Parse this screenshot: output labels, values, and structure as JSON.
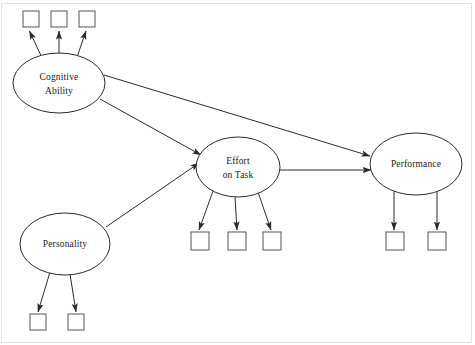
{
  "diagram": {
    "type": "structural-equation-model-path-diagram",
    "background_color": "#ffffff",
    "line_color": "#2b2b2b",
    "indicator_stroke_color": "#555555",
    "frame_color": "#e2e2e2",
    "latent_variables": [
      {
        "id": "cognitive-ability",
        "label_line_1": "Cognitive",
        "label_line_2": "Ability",
        "cx": 59,
        "cy": 83,
        "rx": 46,
        "ry": 30
      },
      {
        "id": "personality",
        "label_line_1": "Personality",
        "label_line_2": "",
        "cx": 65,
        "cy": 244,
        "rx": 45,
        "ry": 31
      },
      {
        "id": "effort-on-task",
        "label_line_1": "Effort",
        "label_line_2": "on Task",
        "cx": 238,
        "cy": 167,
        "rx": 42,
        "ry": 30
      },
      {
        "id": "performance",
        "label_line_1": "Performance",
        "label_line_2": "",
        "cx": 416,
        "cy": 164,
        "rx": 46,
        "ry": 31
      }
    ],
    "indicators": [
      {
        "id": "cognitive-ability-indicator-1",
        "x": 23,
        "y": 11,
        "size": 16
      },
      {
        "id": "cognitive-ability-indicator-2",
        "x": 51,
        "y": 11,
        "size": 16
      },
      {
        "id": "cognitive-ability-indicator-3",
        "x": 79,
        "y": 11,
        "size": 16
      },
      {
        "id": "personality-indicator-1",
        "x": 30,
        "y": 314,
        "size": 16
      },
      {
        "id": "personality-indicator-2",
        "x": 68,
        "y": 314,
        "size": 16
      },
      {
        "id": "effort-on-task-indicator-1",
        "x": 191,
        "y": 232,
        "size": 18
      },
      {
        "id": "effort-on-task-indicator-2",
        "x": 228,
        "y": 232,
        "size": 18
      },
      {
        "id": "effort-on-task-indicator-3",
        "x": 263,
        "y": 232,
        "size": 18
      },
      {
        "id": "performance-indicator-1",
        "x": 386,
        "y": 232,
        "size": 18
      },
      {
        "id": "performance-indicator-2",
        "x": 428,
        "y": 232,
        "size": 18
      }
    ],
    "structural_paths": [
      {
        "id": "path-cognitive-ability-to-performance",
        "from": "cognitive-ability",
        "to": "performance"
      },
      {
        "id": "path-cognitive-ability-to-effort-on-task",
        "from": "cognitive-ability",
        "to": "effort-on-task"
      },
      {
        "id": "path-personality-to-effort-on-task",
        "from": "personality",
        "to": "effort-on-task"
      },
      {
        "id": "path-effort-on-task-to-performance",
        "from": "effort-on-task",
        "to": "performance"
      }
    ],
    "measurement_paths": [
      {
        "id": "loading-cognitive-ability-1",
        "from": "cognitive-ability",
        "to": "cognitive-ability-indicator-1"
      },
      {
        "id": "loading-cognitive-ability-2",
        "from": "cognitive-ability",
        "to": "cognitive-ability-indicator-2"
      },
      {
        "id": "loading-cognitive-ability-3",
        "from": "cognitive-ability",
        "to": "cognitive-ability-indicator-3"
      },
      {
        "id": "loading-personality-1",
        "from": "personality",
        "to": "personality-indicator-1"
      },
      {
        "id": "loading-personality-2",
        "from": "personality",
        "to": "personality-indicator-2"
      },
      {
        "id": "loading-effort-on-task-1",
        "from": "effort-on-task",
        "to": "effort-on-task-indicator-1"
      },
      {
        "id": "loading-effort-on-task-2",
        "from": "effort-on-task",
        "to": "effort-on-task-indicator-2"
      },
      {
        "id": "loading-effort-on-task-3",
        "from": "effort-on-task",
        "to": "effort-on-task-indicator-3"
      },
      {
        "id": "loading-performance-1",
        "from": "performance",
        "to": "performance-indicator-1"
      },
      {
        "id": "loading-performance-2",
        "from": "performance",
        "to": "performance-indicator-2"
      }
    ]
  }
}
